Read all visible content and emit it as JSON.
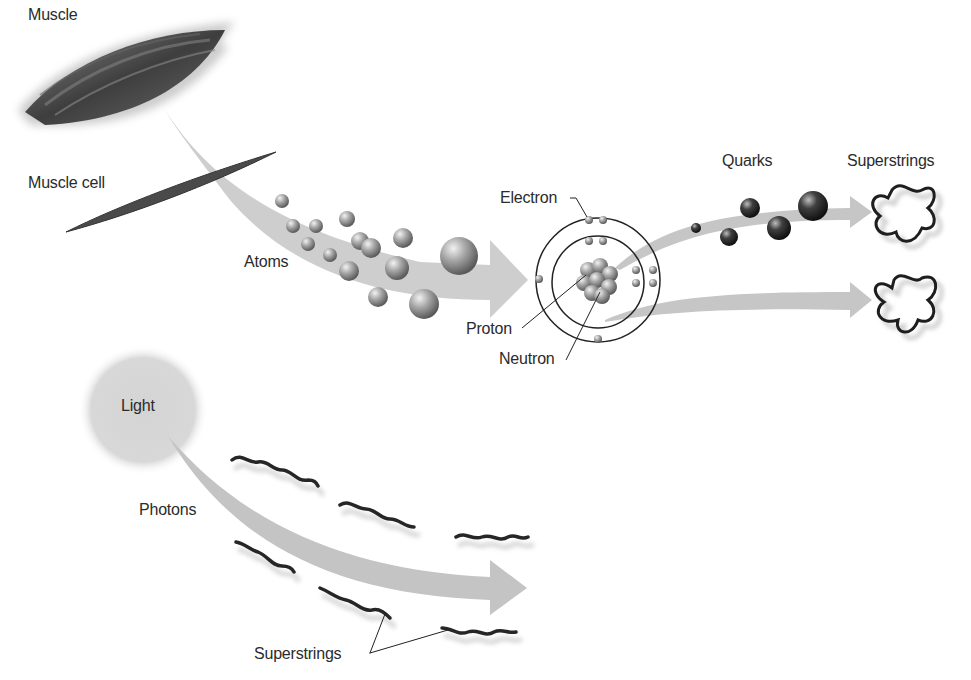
{
  "diagram": {
    "title": "",
    "labels": {
      "muscle": "Muscle",
      "muscle_cell": "Muscle cell",
      "atoms": "Atoms",
      "electron": "Electron",
      "proton": "Proton",
      "neutron": "Neutron",
      "quarks": "Quarks",
      "superstrings_top": "Superstrings",
      "light": "Light",
      "photons": "Photons",
      "superstrings_bottom": "Superstrings"
    },
    "colors": {
      "background": "#ffffff",
      "arrow": "#c8c8c8",
      "muscle": "#4a4a4a",
      "sphere_light": "#d8d8d8",
      "sphere_dark": "#6a6a6a",
      "quark": "#2a2a2a",
      "orbit": "#222222",
      "light_glow": "#d0d0d0",
      "string": "#2a2a2a",
      "text": "#2b2b2b"
    }
  }
}
